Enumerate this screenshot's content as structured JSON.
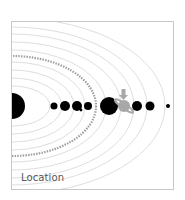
{
  "caption": "Location",
  "diagram": {
    "type": "solar-system-orbits",
    "colors": {
      "planet": "#000000",
      "orbit": "#dcdcdc",
      "highlight": "#a8a8a8",
      "asteroid_belt": "#9a9a9a",
      "border": "#c8c8c8"
    },
    "bodies": [
      {
        "name": "sun",
        "cx": 0,
        "r": 13
      },
      {
        "name": "mercury",
        "cx": 42,
        "r": 3.5
      },
      {
        "name": "venus",
        "cx": 53,
        "r": 5
      },
      {
        "name": "earth",
        "cx": 65,
        "r": 5
      },
      {
        "name": "mars",
        "cx": 76,
        "r": 4
      },
      {
        "name": "jupiter",
        "cx": 97,
        "r": 9
      },
      {
        "name": "saturn",
        "cx": 112,
        "r": 6,
        "highlighted": true
      },
      {
        "name": "uranus",
        "cx": 125,
        "r": 5
      },
      {
        "name": "neptune",
        "cx": 138,
        "r": 4.5
      },
      {
        "name": "pluto",
        "cx": 156,
        "r": 2
      }
    ]
  }
}
